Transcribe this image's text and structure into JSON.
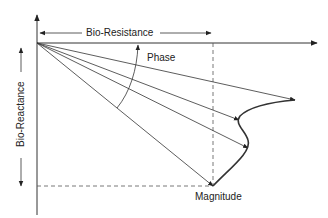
{
  "diagram": {
    "title": "",
    "labels": {
      "x_dimension": "Bio-Resistance",
      "y_dimension": "Bio-Reactance",
      "phase": "Phase",
      "magnitude": "Magnitude"
    },
    "origin": [
      37,
      43
    ],
    "vector_tips": [
      [
        295,
        100
      ],
      [
        239,
        120
      ],
      [
        248,
        148
      ],
      [
        213,
        186
      ]
    ],
    "colors": {
      "line": "#333333",
      "dashed": "#555555",
      "text": "#222222"
    }
  }
}
